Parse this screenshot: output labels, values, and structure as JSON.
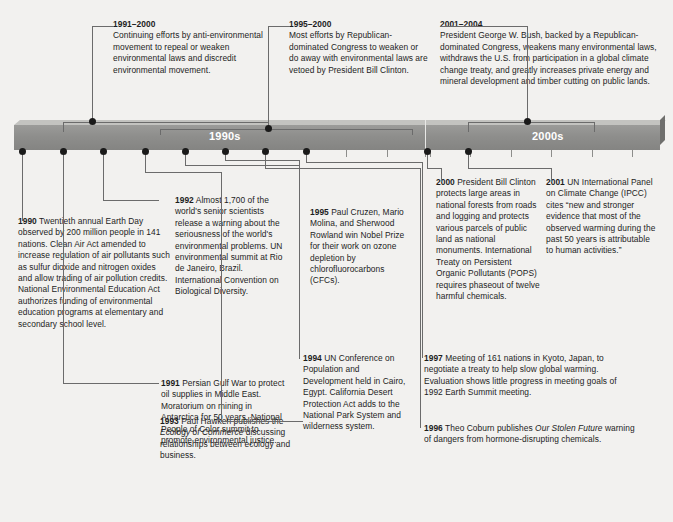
{
  "timeline": {
    "segments": [
      {
        "label": "1990s"
      },
      {
        "label": "2000s"
      }
    ]
  },
  "top_callouts": [
    {
      "id": "c1991-2000",
      "year": "1991–2000",
      "body": "Continuing efforts by anti-environmental movement to repeal or weaken environmental laws and discredit environmental movement."
    },
    {
      "id": "c1995-2000",
      "year": "1995–2000",
      "body": "Most efforts by Republican-dominated Congress to weaken or do away with environmental laws are vetoed by President Bill Clinton."
    },
    {
      "id": "c2001-2004",
      "year": "2001–2004",
      "body": "President George W. Bush, backed by a Republican-dominated Congress, weakens many environmental laws, withdraws the U.S. from participation in a global climate change treaty, and greatly increases private energy and mineral development and timber cutting on public lands."
    }
  ],
  "bottom_callouts": [
    {
      "id": "c1990",
      "year": "1990",
      "body": "Twentieth annual Earth Day observed by 200 million people in 141 nations. Clean Air Act amended to increase regulation of air pollutants such as sulfur dioxide and nitrogen oxides and allow trading of air pollution credits. National Environmental Education Act authorizes funding of environmental education programs at elementary and secondary school level."
    },
    {
      "id": "c1991",
      "year": "1991",
      "body": "Persian Gulf War to protect oil supplies in Middle East. Moratorium on mining in Antarctica for 50 years. National People of Color summit to promote environmental justice."
    },
    {
      "id": "c1992",
      "year": "1992",
      "body": "Almost 1,700 of the world's senior scientists release a warning about the seriousness of the world's environmental problems. UN environmental summit at Rio de Janeiro, Brazil. International Convention on Biological Diversity."
    },
    {
      "id": "c1993",
      "year": "1993",
      "body_part1": "Paul Hawken publishes the ",
      "body_italic": "Ecology of Commerce",
      "body_part2": " discussing relationships between ecology and business."
    },
    {
      "id": "c1994",
      "year": "1994",
      "body": "UN Conference on  Population and Development held in Cairo, Egypt. California Desert Protection Act adds to the National Park System and wilderness system."
    },
    {
      "id": "c1995",
      "year": "1995",
      "body": "Paul Cruzen, Mario Molina, and Sherwood Rowland win Nobel Prize for their work on ozone depletion by chlorofluorocarbons (CFCs)."
    },
    {
      "id": "c1996",
      "year": "1996",
      "body_part1": "Theo Coburn publishes ",
      "body_italic": "Our Stolen Future",
      "body_part2": " warning of dangers from hormone-disrupting chemicals."
    },
    {
      "id": "c1997",
      "year": "1997",
      "body": "Meeting of 161 nations in Kyoto, Japan, to negotiate a treaty to help slow global warming. Evaluation shows little progress in meeting goals of 1992 Earth Summit meeting."
    },
    {
      "id": "c2000",
      "year": "2000",
      "body": "President Bill Clinton protects large areas in national forests from roads and logging and protects various parcels of public land as national monuments. International Treaty on Persistent Organic Pollutants (POPS) requires phaseout of twelve harmful chemicals."
    },
    {
      "id": "c2001",
      "year": "2001",
      "body": "UN International Panel on Climate Change (IPCC) cites “new and stronger evidence that most of the observed warming during the past 50 years is attributable to human activities.”"
    }
  ],
  "colors": {
    "background": "#f2f1ef",
    "bar_face": "#8e8e8c",
    "bar_top": "#c3c3c0",
    "bar_shadow": "#6f6f6d",
    "text": "#1d1d1d",
    "connector": "#6b6b6b",
    "dot": "#1a1a1a",
    "decade_text": "#ffffff"
  }
}
